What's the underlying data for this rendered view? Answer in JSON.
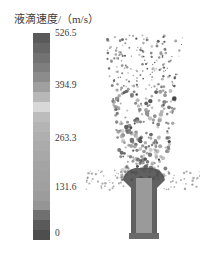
{
  "chart_data": {
    "type": "heatmap",
    "title": "液滴速度/（m/s）",
    "colorbar": {
      "label": "液滴速度/（m/s）",
      "min": 0,
      "max": 526.5,
      "ticks": [
        {
          "value": 526.5,
          "label": "526.5"
        },
        {
          "value": 394.9,
          "label": "394.9"
        },
        {
          "value": 263.3,
          "label": "263.3"
        },
        {
          "value": 131.6,
          "label": "131.6"
        },
        {
          "value": 0,
          "label": "0"
        }
      ],
      "bands_top_to_bottom": [
        "#5a5a5a",
        "#666666",
        "#727272",
        "#7e7e7e",
        "#8c8c8c",
        "#a0a0a0",
        "#b8b8b8",
        "#d8d8d8",
        "#bcbcbc",
        "#b4b4b4",
        "#afafaf",
        "#ababab",
        "#a8a8a8",
        "#a4a4a4",
        "#a2a2a2",
        "#a0a0a0",
        "#9c9c9c",
        "#959595",
        "#707070",
        "#5a5a5a",
        "#4e4e4e"
      ]
    },
    "xlabel": "",
    "ylabel": ""
  },
  "legend": {
    "title": "液滴速度/（m/s）",
    "ticks": [
      "526.5",
      "394.9",
      "263.3",
      "131.6",
      "0"
    ]
  }
}
